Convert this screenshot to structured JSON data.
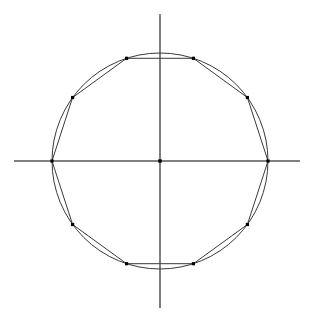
{
  "figure": {
    "title": "",
    "background_color": "#ffffff",
    "width": 314,
    "height": 322
  },
  "chart_data": {
    "type": "scatter",
    "title": "",
    "subtitle": "",
    "xlabel": "",
    "ylabel": "",
    "grid": false,
    "legend": null,
    "axes": {
      "x_axis": {
        "from": [
          -146,
          0
        ],
        "to": [
          140,
          0
        ],
        "color": "#808080",
        "width": 1.2
      },
      "y_axis": {
        "from": [
          0,
          147
        ],
        "to": [
          0,
          -147
        ],
        "color": "#808080",
        "width": 1.2
      },
      "xlim": [
        -157,
        154
      ],
      "ylim": [
        -161,
        161
      ],
      "ticks": [],
      "tick_labels": []
    },
    "origin_marker": {
      "x": 0,
      "y": 0,
      "label": "",
      "color": "#000000",
      "size": 3.4
    },
    "circle": {
      "center": [
        0,
        0
      ],
      "radius": 108,
      "color": "#3a3a3a",
      "width": 1.0,
      "fill": "none"
    },
    "polygon": {
      "sides": 10,
      "name": "decagon",
      "inscribed_radius": 108,
      "rotation_degrees": 0,
      "stroke_color": "#3a3a3a",
      "stroke_width": 1.0,
      "fill": "none",
      "vertex_marker": {
        "shape": "square",
        "color": "#000000",
        "size": 3.2
      },
      "vertices": [
        {
          "index": 0,
          "angle_deg": 0,
          "x": 108.0,
          "y": 0.0
        },
        {
          "index": 1,
          "angle_deg": 36,
          "x": 87.4,
          "y": 63.5
        },
        {
          "index": 2,
          "angle_deg": 72,
          "x": 33.4,
          "y": 102.7
        },
        {
          "index": 3,
          "angle_deg": 108,
          "x": -33.4,
          "y": 102.7
        },
        {
          "index": 4,
          "angle_deg": 144,
          "x": -87.4,
          "y": 63.5
        },
        {
          "index": 5,
          "angle_deg": 180,
          "x": -108.0,
          "y": 0.0
        },
        {
          "index": 6,
          "angle_deg": 216,
          "x": -87.4,
          "y": -63.5
        },
        {
          "index": 7,
          "angle_deg": 252,
          "x": -33.4,
          "y": -102.7
        },
        {
          "index": 8,
          "angle_deg": 288,
          "x": 33.4,
          "y": -102.7
        },
        {
          "index": 9,
          "angle_deg": 324,
          "x": 87.4,
          "y": -63.5
        }
      ]
    },
    "pixel_mapping": {
      "center_px": [
        160,
        161
      ],
      "scale_px_per_unit": 1.0,
      "y_axis_points_up": true
    }
  }
}
